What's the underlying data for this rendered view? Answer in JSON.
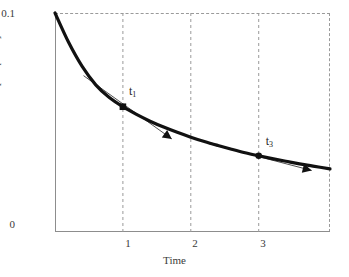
{
  "chart_data": {
    "type": "line",
    "title": "",
    "xlabel": "Time",
    "ylabel": "[compound]",
    "xlim": [
      0,
      4.05
    ],
    "ylim": [
      0,
      0.1
    ],
    "grid": true,
    "legend": false,
    "ytick_labels": [
      "0.1",
      "0"
    ],
    "ytick_values": [
      0.1,
      0
    ],
    "xtick_labels": [
      "1",
      "2",
      "3"
    ],
    "xtick_values": [
      1,
      2,
      3
    ],
    "series": [
      {
        "name": "compound concentration",
        "style": "thick-solid-curve",
        "x": [
          0,
          0.2,
          0.4,
          0.6,
          0.8,
          1.0,
          1.2,
          1.4,
          1.6,
          1.8,
          2.0,
          2.2,
          2.4,
          2.6,
          2.8,
          3.0,
          3.2,
          3.4,
          3.6,
          3.8,
          4.05
        ],
        "y": [
          0.1,
          0.0866,
          0.0756,
          0.0672,
          0.0614,
          0.0572,
          0.0537,
          0.0506,
          0.0479,
          0.0455,
          0.0433,
          0.0413,
          0.0395,
          0.0378,
          0.0362,
          0.0348,
          0.0335,
          0.0323,
          0.0311,
          0.0301,
          0.0288
        ]
      }
    ],
    "markers": [
      {
        "label": "t1",
        "label_text": "t",
        "subscript": "1",
        "x": 1.0,
        "y": 0.0572,
        "shape": "square"
      },
      {
        "label": "t3",
        "label_text": "t",
        "subscript": "3",
        "x": 3.0,
        "y": 0.0348,
        "shape": "circle"
      }
    ],
    "annotations": [
      {
        "name": "tangent-at-t1",
        "type": "tangent-line-with-arrow",
        "x_start": 0.42,
        "y_start": 0.0714,
        "x_end": 1.72,
        "y_end": 0.0425,
        "arrow_at": "end"
      },
      {
        "name": "tangent-at-t3",
        "type": "tangent-line-with-arrow",
        "x_start": 2.26,
        "y_start": 0.0404,
        "x_end": 3.78,
        "y_end": 0.0281,
        "arrow_at": "end"
      }
    ]
  },
  "axes": {
    "y_top_label": "0.1",
    "y_bottom_label": "0",
    "y_title": "[compound]",
    "x_title": "Time",
    "x_labels": [
      "1",
      "2",
      "3"
    ]
  },
  "labels": {
    "t1": "t",
    "t1_sub": "1",
    "t3": "t",
    "t3_sub": "3"
  },
  "colors": {
    "curve": "#111111",
    "grid": "#9a9a9a",
    "axis": "#8d8d8d",
    "text": "#3a3a3a",
    "tangent": "#3c3c3c",
    "background": "#ffffff"
  }
}
